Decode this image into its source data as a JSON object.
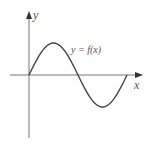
{
  "diagram": {
    "type": "function-graph",
    "y_axis_label": "y",
    "x_axis_label": "x",
    "curve_label": "y = f(x)",
    "curve": "one full period of a sine-like wave starting at origin: rises to a maximum, crosses x-axis, falls to a minimum, returns to x-axis",
    "colors": {
      "axis": "#555555",
      "curve": "#444444",
      "text": "#555555"
    }
  }
}
